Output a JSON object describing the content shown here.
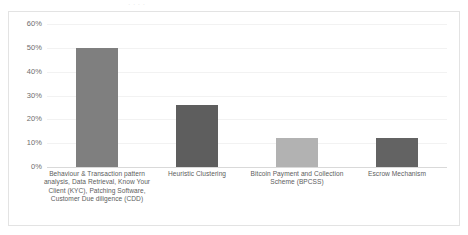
{
  "page": {
    "background_color": "#ffffff",
    "frame_border_color": "#e3e3e3",
    "cropped_header_fragment": "· · · ·"
  },
  "chart_data": {
    "type": "bar",
    "title": "",
    "xlabel": "",
    "ylabel": "",
    "ylim": [
      0,
      60
    ],
    "ytick_labels": [
      "60%",
      "50%",
      "40%",
      "30%",
      "20%",
      "10%",
      "0%"
    ],
    "ytick_values": [
      60,
      50,
      40,
      30,
      20,
      10,
      0
    ],
    "grid": true,
    "legend": "none",
    "value_suffix": "%",
    "categories": [
      "Behaviour & Transaction pattern analysis, Data Retrieval, Know Your Client (KYC), Patching Software, Customer Due diligence (CDD)",
      "Heuristic Clustering",
      "Bitcoin Payment and Collection Scheme (BPCSS)",
      "Escrow Mechanism"
    ],
    "values": [
      50,
      26,
      12,
      12
    ],
    "bar_colors": [
      "#7f7f7f",
      "#5e5e5e",
      "#b2b2b2",
      "#636363"
    ],
    "bars": [
      {
        "label": "Behaviour & Transaction pattern analysis, Data Retrieval, Know Your Client (KYC), Patching Software, Customer Due diligence (CDD)",
        "value": 50,
        "color": "#7f7f7f"
      },
      {
        "label": "Heuristic Clustering",
        "value": 26,
        "color": "#5e5e5e"
      },
      {
        "label": "Bitcoin Payment and Collection Scheme (BPCSS)",
        "value": 12,
        "color": "#b2b2b2"
      },
      {
        "label": "Escrow Mechanism",
        "value": 12,
        "color": "#636363"
      }
    ]
  }
}
